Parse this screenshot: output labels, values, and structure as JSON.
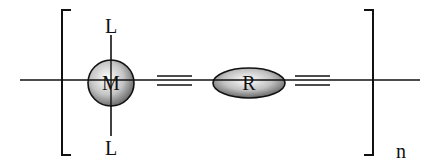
{
  "diagram": {
    "metal": {
      "label": "M",
      "ligand_top": "L",
      "ligand_bottom": "L"
    },
    "spacer": {
      "label": "R"
    },
    "bonds": [
      "triple",
      "triple"
    ],
    "repeat_subscript": "n",
    "colors": {
      "line": "#111111",
      "sphere_light": "#ffffff",
      "sphere_dark": "#6e6e6e"
    }
  }
}
